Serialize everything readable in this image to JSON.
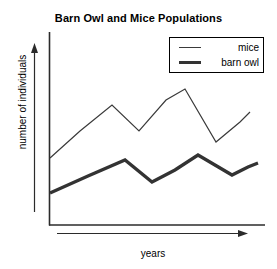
{
  "chart_data": {
    "type": "line",
    "title": "Barn Owl and Mice Populations",
    "xlabel": "years",
    "ylabel": "number of individuals",
    "grid": false,
    "legend_position": "top-right",
    "axis_style": "arrow-axes-unlabeled-ticks",
    "xlim": [
      0,
      10
    ],
    "ylim": [
      0,
      10
    ],
    "x": [
      0,
      1,
      2,
      3,
      4,
      5,
      6,
      7,
      8
    ],
    "series": [
      {
        "name": "mice",
        "line_weight": "thin",
        "color": "#3a3a3a",
        "values": [
          3.4,
          4.6,
          5.9,
          4.6,
          6.4,
          7.3,
          4.4,
          5.5,
          6.2
        ],
        "points_px": [
          [
            50,
            158
          ],
          [
            80,
            131
          ],
          [
            112,
            105
          ],
          [
            139,
            131
          ],
          [
            166,
            100
          ],
          [
            185,
            89
          ],
          [
            216,
            142
          ],
          [
            240,
            122
          ],
          [
            250,
            112
          ]
        ]
      },
      {
        "name": "barn owl",
        "line_weight": "thick",
        "color": "#333333",
        "values": [
          1.6,
          2.2,
          2.8,
          2.2,
          2.6,
          3.2,
          2.2,
          2.5,
          2.8
        ],
        "points_px": [
          [
            50,
            193
          ],
          [
            88,
            176
          ],
          [
            125,
            160
          ],
          [
            152,
            182
          ],
          [
            175,
            170
          ],
          [
            198,
            155
          ],
          [
            232,
            175
          ],
          [
            248,
            167
          ],
          [
            258,
            163
          ]
        ]
      }
    ]
  },
  "chart": {
    "title": "Barn Owl and Mice Populations",
    "ylabel": "number of individuals",
    "xlabel": "years",
    "legend": {
      "entries": [
        {
          "label": "mice",
          "style": "thin-line"
        },
        {
          "label": "barn owl",
          "style": "thick-line"
        }
      ]
    }
  }
}
